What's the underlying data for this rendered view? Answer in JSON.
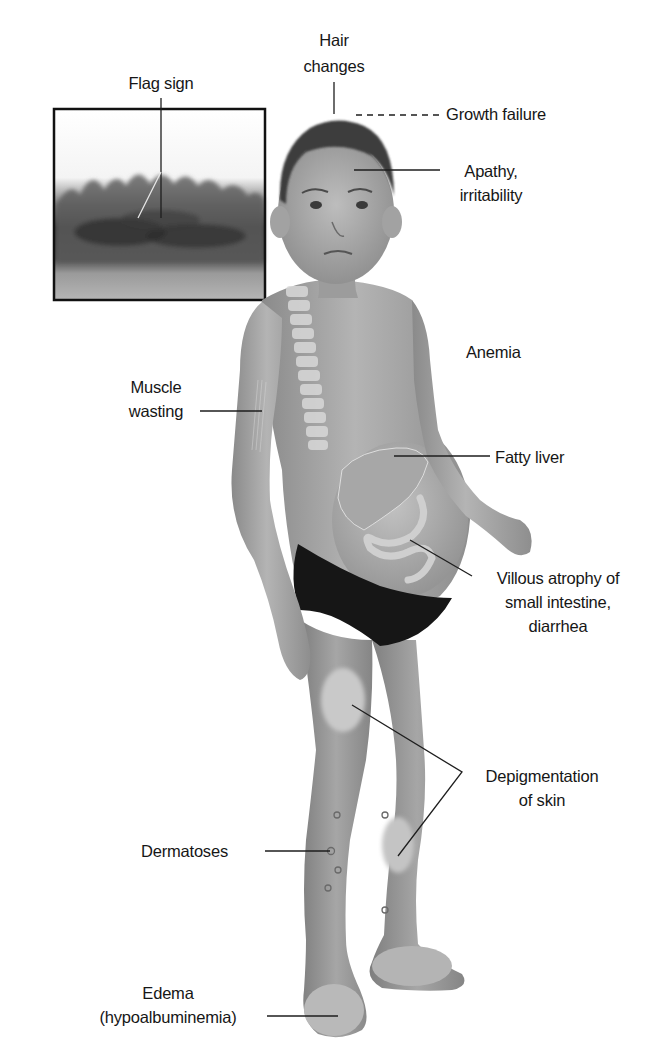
{
  "figure": {
    "inset": {
      "name": "flag-sign-hair-inset",
      "label": "Flag sign"
    },
    "labels": {
      "hair_changes": [
        "Hair",
        "changes"
      ],
      "growth_failure": [
        "Growth failure"
      ],
      "apathy": [
        "Apathy,",
        "irritability"
      ],
      "anemia": [
        "Anemia"
      ],
      "muscle_wasting": [
        "Muscle",
        "wasting"
      ],
      "fatty_liver": [
        "Fatty liver"
      ],
      "villous_atrophy": [
        "Villous atrophy of",
        "small intestine,",
        "diarrhea"
      ],
      "depigmentation": [
        "Depigmentation",
        "of skin"
      ],
      "dermatoses": [
        "Dermatoses"
      ],
      "edema": [
        "Edema",
        "(hypoalbuminemia)"
      ]
    },
    "colors": {
      "background": "#ffffff",
      "text": "#161616",
      "leader_line": "#1e1e1e",
      "skin": "#9a9a9a",
      "skin_light": "#bdbdbd",
      "hair": "#3c3c3c",
      "briefs": "#161616",
      "inset_border": "#111111"
    }
  }
}
